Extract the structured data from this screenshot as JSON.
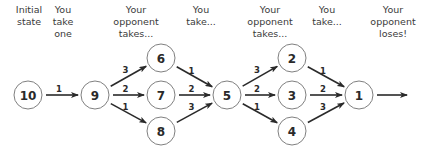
{
  "headers": [
    {
      "id": "initial",
      "x": 29,
      "lines": [
        "Initial",
        "state"
      ]
    },
    {
      "id": "you-take-one",
      "x": 63,
      "lines": [
        "You",
        "take",
        "one"
      ]
    },
    {
      "id": "opponent-takes-1",
      "x": 136,
      "lines": [
        "Your",
        "opponent",
        "takes..."
      ]
    },
    {
      "id": "you-take-1",
      "x": 201,
      "lines": [
        "You",
        "take..."
      ]
    },
    {
      "id": "opponent-takes-2",
      "x": 270,
      "lines": [
        "Your",
        "opponent",
        "takes..."
      ]
    },
    {
      "id": "you-take-2",
      "x": 327,
      "lines": [
        "You",
        "take..."
      ]
    },
    {
      "id": "opponent-loses",
      "x": 393,
      "lines": [
        "Your",
        "opponent",
        "loses!"
      ]
    }
  ],
  "nodes": [
    {
      "id": "n10",
      "label": "10",
      "x": 28,
      "y": 95
    },
    {
      "id": "n9",
      "label": "9",
      "x": 95,
      "y": 95
    },
    {
      "id": "n6",
      "label": "6",
      "x": 161,
      "y": 58
    },
    {
      "id": "n7",
      "label": "7",
      "x": 161,
      "y": 95
    },
    {
      "id": "n8",
      "label": "8",
      "x": 161,
      "y": 131
    },
    {
      "id": "n5",
      "label": "5",
      "x": 227,
      "y": 95
    },
    {
      "id": "n2",
      "label": "2",
      "x": 292,
      "y": 58
    },
    {
      "id": "n3",
      "label": "3",
      "x": 292,
      "y": 95
    },
    {
      "id": "n4",
      "label": "4",
      "x": 292,
      "y": 131
    },
    {
      "id": "n1",
      "label": "1",
      "x": 359,
      "y": 95
    }
  ],
  "edges": [
    {
      "from": "n10",
      "to": "n9",
      "label": "1"
    },
    {
      "from": "n9",
      "to": "n6",
      "label": "3"
    },
    {
      "from": "n9",
      "to": "n7",
      "label": "2"
    },
    {
      "from": "n9",
      "to": "n8",
      "label": "1"
    },
    {
      "from": "n6",
      "to": "n5",
      "label": "1"
    },
    {
      "from": "n7",
      "to": "n5",
      "label": "2"
    },
    {
      "from": "n8",
      "to": "n5",
      "label": "3"
    },
    {
      "from": "n5",
      "to": "n2",
      "label": "3"
    },
    {
      "from": "n5",
      "to": "n3",
      "label": "2"
    },
    {
      "from": "n5",
      "to": "n4",
      "label": "1"
    },
    {
      "from": "n2",
      "to": "n1",
      "label": "1"
    },
    {
      "from": "n3",
      "to": "n1",
      "label": "2"
    },
    {
      "from": "n4",
      "to": "n1",
      "label": "3"
    },
    {
      "from": "n1",
      "to": "out",
      "label": ""
    }
  ],
  "exit_arrow": {
    "x1": 377,
    "y1": 95,
    "x2": 407,
    "y2": 95
  },
  "node_radius": 14,
  "colors": {
    "stroke": "#808080",
    "arrow": "#2a2a2a",
    "text": "#2a2a2a",
    "header_text": "#3a3a3a"
  }
}
